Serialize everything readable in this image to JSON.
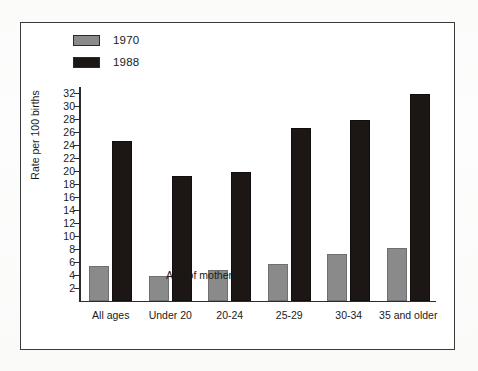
{
  "chart_data": {
    "type": "bar",
    "title": "",
    "xlabel": "Age of mother",
    "ylabel": "Rate per 100 births",
    "categories": [
      "All ages",
      "Under 20",
      "20-24",
      "25-29",
      "30-34",
      "35 and older"
    ],
    "series": [
      {
        "name": "1970",
        "color": "#8a8a8a",
        "values": [
          5.4,
          3.8,
          4.7,
          5.7,
          7.2,
          8.1
        ]
      },
      {
        "name": "1988",
        "color": "#1c1614",
        "values": [
          24.7,
          19.2,
          19.8,
          26.6,
          27.9,
          31.9
        ]
      }
    ],
    "ylim": [
      0,
      33
    ],
    "yticks": [
      2,
      4,
      6,
      8,
      10,
      12,
      14,
      16,
      18,
      20,
      22,
      24,
      26,
      28,
      30,
      32
    ],
    "grid": false,
    "legend_position": "top-left"
  },
  "legend": {
    "items": [
      {
        "label": "1970",
        "color": "#8a8a8a"
      },
      {
        "label": "1988",
        "color": "#1c1614"
      }
    ]
  }
}
